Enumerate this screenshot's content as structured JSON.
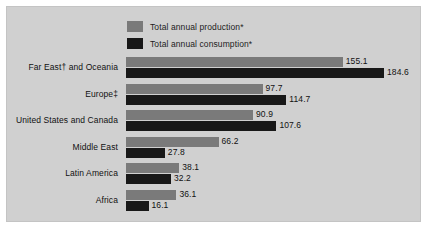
{
  "legend": {
    "items": [
      {
        "label": "Total annual production*",
        "color": "#7a7a7a",
        "swatch_name": "legend-swatch-production"
      },
      {
        "label": "Total annual consumption*",
        "color": "#181818",
        "swatch_name": "legend-swatch-consumption"
      }
    ]
  },
  "panel": {
    "background_color": "#d0d0d0"
  },
  "chart_data": {
    "type": "bar",
    "orientation": "horizontal",
    "title": "",
    "subtitle": "",
    "xlabel": "",
    "ylabel": "",
    "grid": false,
    "legend_position": "top-center",
    "xlim": [
      0,
      184.6
    ],
    "categories": [
      "Far East† and Oceania",
      "Europe‡",
      "United States and Canada",
      "Middle East",
      "Latin America",
      "Africa"
    ],
    "series": [
      {
        "name": "Total annual production*",
        "color": "#7a7a7a",
        "values": [
          155.1,
          97.7,
          90.9,
          66.2,
          38.1,
          36.1
        ],
        "labels": [
          "155.1",
          "97.7",
          "90.9",
          "66.2",
          "38.1",
          "36.1"
        ]
      },
      {
        "name": "Total annual consumption*",
        "color": "#181818",
        "values": [
          184.6,
          114.7,
          107.6,
          27.8,
          32.2,
          16.1
        ],
        "labels": [
          "184.6",
          "114.7",
          "107.6",
          "27.8",
          "32.2",
          "16.1"
        ]
      }
    ]
  }
}
